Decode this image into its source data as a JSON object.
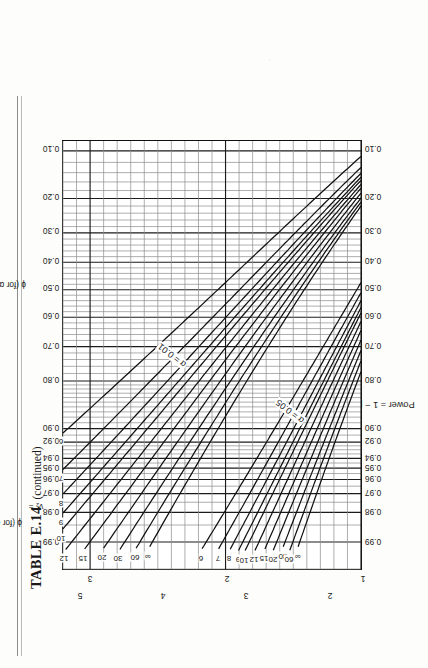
{
  "document": {
    "table_number": "TABLE E.14",
    "continued_note": "(continued)"
  },
  "chart_labels": {
    "power_axis_caption": "Power = 1 − β",
    "phi_alpha_01_caption": "ϕ (for α = 0.01)",
    "phi_alpha_05_caption": "ϕ (for α = 0.05)",
    "arrow": "———",
    "nu1_caption": "ν₁ = 3",
    "nu2_caption": "ν₂ =",
    "alpha_01_label": "α = 0.01",
    "alpha_05_label": "α = 0.05"
  },
  "chart_data": {
    "type": "line",
    "subtitle": "Pearson–Hartley power curves for the fixed-effects model analysis of variance",
    "xlabel": "Power = 1 − β",
    "ylabel": "ϕ (noncentrality parameter)",
    "orientation": "page rotated 90° counter-clockwise (landscape chart on portrait page)",
    "grid": true,
    "legend": "curve labels ν₂ printed at both ends of each curve",
    "numerator_df": 3,
    "power_ticks": [
      "0.99",
      "0.98",
      "0.97",
      "0.96",
      "0.95",
      "0.94",
      "0.92",
      "0.90",
      "0.80",
      "0.70",
      "0.60",
      "0.50",
      "0.40",
      "0.30",
      "0.20",
      "0.10"
    ],
    "power_tick_values": [
      0.99,
      0.98,
      0.97,
      0.96,
      0.95,
      0.94,
      0.92,
      0.9,
      0.8,
      0.7,
      0.6,
      0.5,
      0.4,
      0.3,
      0.2,
      0.1
    ],
    "phi_ticks_alpha_01": [
      "1",
      "2",
      "3"
    ],
    "phi_ticks_alpha_01_values": [
      1,
      2,
      3
    ],
    "phi_ticks_alpha_05": [
      "2",
      "3",
      "4",
      "5"
    ],
    "phi_ticks_alpha_05_values": [
      2,
      3,
      4,
      5
    ],
    "phi_axis_range_alpha_01": [
      1,
      3.2
    ],
    "phi_axis_range_alpha_05": [
      1.6,
      5.2
    ],
    "nu2_curve_labels": [
      "6",
      "7",
      "8",
      "9",
      "10",
      "12",
      "15",
      "20",
      "30",
      "60",
      "∞"
    ],
    "curve_families": [
      {
        "name": "α = 0.01",
        "alpha": 0.01,
        "nu2": [
          "6",
          "7",
          "8",
          "9",
          "10",
          "12",
          "15",
          "20",
          "30",
          "60",
          "∞"
        ]
      },
      {
        "name": "α = 0.05",
        "alpha": 0.05,
        "nu2": [
          "6",
          "7",
          "8",
          "9",
          "10",
          "12",
          "15",
          "20",
          "30",
          "60",
          "∞"
        ]
      }
    ]
  }
}
